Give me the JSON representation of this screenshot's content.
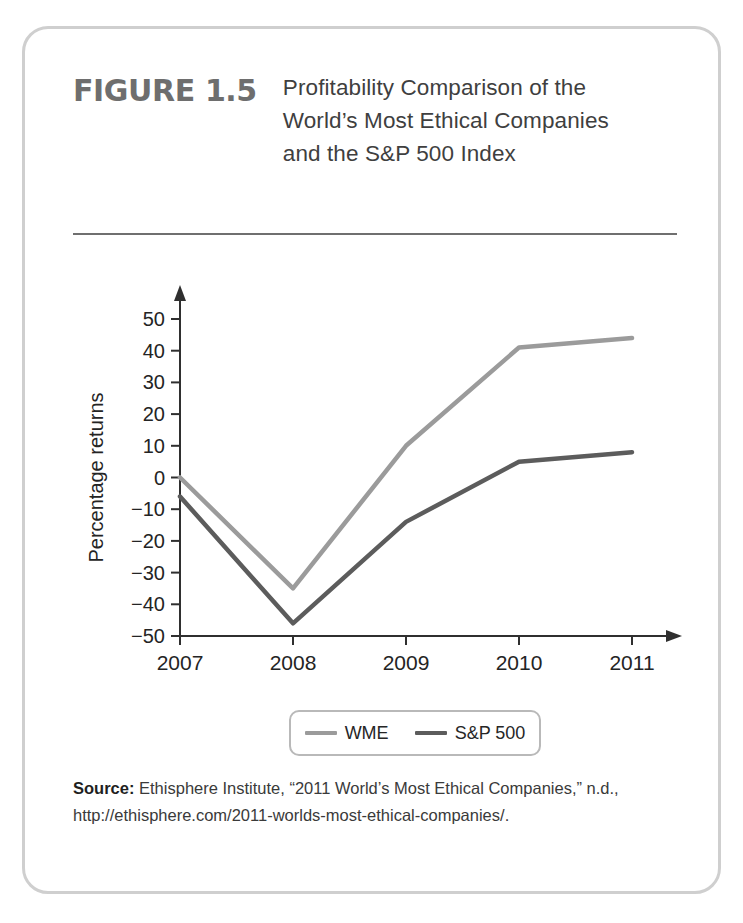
{
  "figure": {
    "number_label": "FIGURE 1.5",
    "title": "Profitability Comparison of the World’s Most Ethical Companies and the S&P 500 Index"
  },
  "legend": {
    "entries": [
      {
        "label": "WME",
        "color": "#9b9b9b"
      },
      {
        "label": "S&P 500",
        "color": "#5c5c5c"
      }
    ]
  },
  "source": {
    "label": "Source:",
    "text": " Ethisphere Institute, “2011 World’s Most Ethical Companies,” n.d., http://ethisphere.com/2011-worlds-most-ethical-companies/."
  },
  "chart_data": {
    "type": "line",
    "title": "",
    "xlabel": "Year to date",
    "ylabel": "Percentage returns",
    "x": [
      "2007",
      "2008",
      "2009",
      "2010",
      "2011"
    ],
    "categories": [
      "2007",
      "2008",
      "2009",
      "2010",
      "2011"
    ],
    "series": [
      {
        "name": "WME",
        "color": "#9b9b9b",
        "values": [
          0,
          -35,
          10,
          41,
          44
        ]
      },
      {
        "name": "S&P 500",
        "color": "#5c5c5c",
        "values": [
          -6,
          -46,
          -14,
          5,
          8
        ]
      }
    ],
    "ylim": [
      -50,
      50
    ],
    "ytick_step": 10,
    "yticks": [
      50,
      40,
      30,
      20,
      10,
      0,
      -10,
      -20,
      -30,
      -40,
      -50
    ],
    "ytick_labels": [
      "50",
      "40",
      "30",
      "20",
      "10",
      "0",
      "−10",
      "−20",
      "−30",
      "−40",
      "−50"
    ],
    "xticks": [
      "2007",
      "2008",
      "2009",
      "2010",
      "2011"
    ],
    "grid": false,
    "legend_position": "bottom",
    "axis_arrows": true
  }
}
